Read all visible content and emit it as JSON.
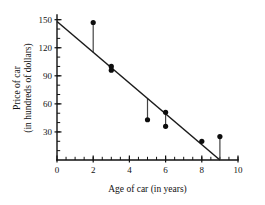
{
  "chart_data": {
    "type": "scatter",
    "title": "",
    "xlabel": "Age of car (in years)",
    "ylabel_line1": "Price of car",
    "ylabel_line2": "(in hundreds of dollars)",
    "xlim": [
      0,
      10
    ],
    "ylim": [
      0,
      155
    ],
    "x_ticks": [
      0,
      2,
      4,
      6,
      8,
      10
    ],
    "x_tick_labels": [
      "0",
      "2",
      "4",
      "6",
      "8",
      "10"
    ],
    "x_minor_step": 0.5,
    "y_ticks": [
      30,
      60,
      90,
      120,
      150
    ],
    "y_tick_labels": [
      "30",
      "60",
      "90",
      "120",
      "150"
    ],
    "y_minor_step": 10,
    "grid": false,
    "legend": "none",
    "point_color": "#0d0d0d",
    "line_color": "#1a1a1a",
    "residual_color": "#444444",
    "background_color": "#ffffff",
    "points": [
      {
        "x": 2,
        "y": 147
      },
      {
        "x": 3,
        "y": 100
      },
      {
        "x": 3,
        "y": 96
      },
      {
        "x": 5,
        "y": 43
      },
      {
        "x": 6,
        "y": 51
      },
      {
        "x": 6,
        "y": 36
      },
      {
        "x": 8,
        "y": 20
      },
      {
        "x": 9,
        "y": 25
      }
    ],
    "fit_line": {
      "name": "least-squares regression line",
      "x_start": 0,
      "y_start": 148,
      "x_end": 9,
      "y_end": 0
    },
    "residuals": [
      {
        "x": 2,
        "y_point": 147,
        "y_line": 115
      },
      {
        "x": 5,
        "y_point": 43,
        "y_line": 66
      },
      {
        "x": 6,
        "y_point": 36,
        "y_line": 49
      },
      {
        "x": 9,
        "y_point": 25,
        "y_line": 0
      }
    ]
  }
}
